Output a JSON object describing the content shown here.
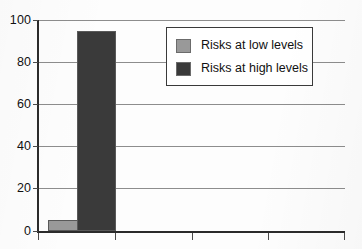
{
  "chart_data": {
    "type": "bar",
    "title": "",
    "subtitle": "",
    "xlabel": "",
    "ylabel": "",
    "categories": [
      "1"
    ],
    "series": [
      {
        "name": "Risks at low levels",
        "values": [
          5
        ],
        "color": "#999999"
      },
      {
        "name": "Risks at high levels",
        "values": [
          95
        ],
        "color": "#3a3a3a"
      }
    ],
    "ylim": [
      0,
      100
    ],
    "yticks": [
      0,
      20,
      40,
      60,
      80,
      100
    ],
    "ytick_labels": [
      "0",
      "20",
      "40",
      "60",
      "80",
      "100"
    ],
    "xtick_labels": [
      "",
      "",
      "",
      "",
      ""
    ],
    "grid": true,
    "grid_axis": "y",
    "legend_position": "upper-center-right",
    "legend_entries": [
      {
        "label": "Risks at low levels",
        "color": "#999999"
      },
      {
        "label": "Risks at high levels",
        "color": "#3a3a3a"
      }
    ]
  },
  "axes": {
    "y_tick_labels": [
      "100",
      "80",
      "60",
      "40",
      "20",
      "0"
    ],
    "line_color": "#2b2b2b",
    "grid_color": "#8d8d8d"
  },
  "legend": {
    "border_color": "#3a3a3a",
    "background": "#ffffff",
    "items": [
      {
        "label": "Risks at low levels",
        "color": "#999999"
      },
      {
        "label": "Risks at high levels",
        "color": "#3a3a3a"
      }
    ]
  },
  "figure": {
    "background": "#fdfdfd"
  }
}
